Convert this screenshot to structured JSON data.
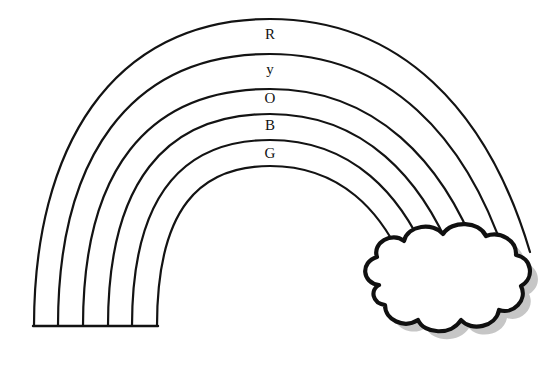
{
  "page": {
    "background_color": "#ffffff",
    "width": 557,
    "height": 367,
    "line_color": "#131313",
    "cloud_outline_color": "#101010",
    "cloud_fill_color": "#ffffff",
    "cloud_shadow_color": "#bcbcbc"
  },
  "rainbow": {
    "name": "rainbow-arc",
    "band_count": 5,
    "arc_count": 6,
    "bands": [
      {
        "letter": "R",
        "color_name": "Red",
        "label_x": 270,
        "label_y": 36
      },
      {
        "letter": "y",
        "color_name": "Yellow",
        "label_y": 71,
        "label_x": 270
      },
      {
        "letter": "O",
        "color_name": "Orange",
        "label_y": 100,
        "label_x": 270
      },
      {
        "letter": "B",
        "color_name": "Blue",
        "label_y": 127,
        "label_x": 270
      },
      {
        "letter": "G",
        "color_name": "Green",
        "label_y": 155,
        "label_x": 270
      }
    ],
    "base": {
      "name": "rainbow-base",
      "bottom_y": 326,
      "left_x": 34,
      "right_x": 157,
      "tick_positions": [
        34,
        58,
        83,
        108,
        132,
        157
      ]
    }
  },
  "cloud": {
    "name": "cloud",
    "center_x": 452,
    "center_y": 295,
    "has_shadow": true
  },
  "labels": {
    "letters_joined": "R y O B G"
  }
}
